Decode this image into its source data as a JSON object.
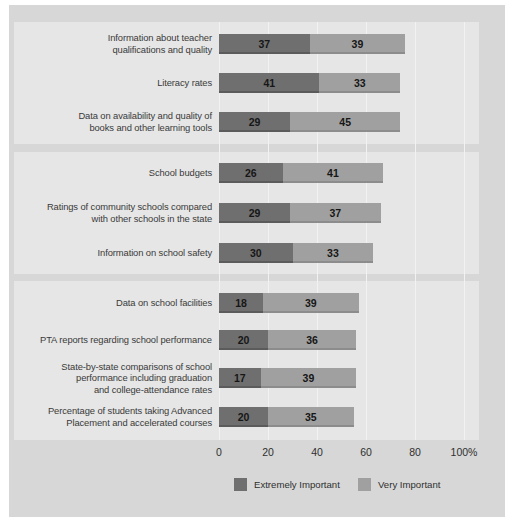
{
  "colors": {
    "page_background": "#ffffff",
    "frame_background": "#d7d7d7",
    "panel_background": "#e6e6e6",
    "gridline": "#f2f2f2",
    "extremely_important": "#6f6f6f",
    "very_important": "#a0a0a0",
    "label_text": "#3a3a3a",
    "value_text": "#161616"
  },
  "legend": {
    "items": [
      {
        "label": "Extremely Important",
        "color": "#6f6f6f",
        "swatch_name": "legend-swatch-extremely-important"
      },
      {
        "label": "Very Important",
        "color": "#a0a0a0",
        "swatch_name": "legend-swatch-very-important"
      }
    ]
  },
  "axis": {
    "ticks": [
      "0",
      "20",
      "40",
      "60",
      "80",
      "100%"
    ],
    "values": [
      0,
      20,
      40,
      60,
      80,
      100
    ]
  },
  "chart_data": {
    "type": "bar",
    "orientation": "horizontal",
    "stacked": true,
    "title": "",
    "subtitle": "",
    "xlabel": "",
    "ylabel": "",
    "xlim": [
      0,
      100
    ],
    "xticks": [
      0,
      20,
      40,
      60,
      80,
      100
    ],
    "xticklabels": [
      "0",
      "20",
      "40",
      "60",
      "80",
      "100%"
    ],
    "grid": true,
    "legend_position": "bottom",
    "series": [
      {
        "name": "Extremely Important",
        "color": "#6f6f6f",
        "values": [
          37,
          41,
          29,
          26,
          29,
          30,
          18,
          20,
          17,
          20
        ]
      },
      {
        "name": "Very Important",
        "color": "#a0a0a0",
        "values": [
          39,
          33,
          45,
          41,
          37,
          33,
          39,
          36,
          39,
          35
        ]
      }
    ],
    "categories": [
      "Information about teacher\nqualifications and quality",
      "Literacy rates",
      "Data on availability and quality of\nbooks and other learning tools",
      "School budgets",
      "Ratings of community schools compared\nwith other schools in the state",
      "Information on school safety",
      "Data on school facilities",
      "PTA reports regarding school performance",
      "State-by-state comparisons of school\nperformance including graduation\nand college-attendance rates",
      "Percentage of students taking Advanced\nPlacement and accelerated courses"
    ],
    "totals": [
      76,
      74,
      74,
      67,
      66,
      63,
      57,
      56,
      56,
      55
    ],
    "groups": [
      {
        "name": "group-1",
        "rows": [
          0,
          1,
          2
        ]
      },
      {
        "name": "group-2",
        "rows": [
          3,
          4,
          5
        ]
      },
      {
        "name": "group-3",
        "rows": [
          6,
          7,
          8,
          9
        ]
      }
    ]
  },
  "rows": [
    {
      "label": "Information about teacher\nqualifications and quality",
      "a": 37,
      "b": 39,
      "y": 34,
      "group": 0
    },
    {
      "label": "Literacy rates",
      "a": 41,
      "b": 33,
      "y": 73,
      "group": 0
    },
    {
      "label": "Data on availability and quality of\nbooks and other learning tools",
      "a": 29,
      "b": 45,
      "y": 112,
      "group": 0
    },
    {
      "label": "School budgets",
      "a": 26,
      "b": 41,
      "y": 163,
      "group": 1
    },
    {
      "label": "Ratings of community schools compared\nwith other schools in the state",
      "a": 29,
      "b": 37,
      "y": 203,
      "group": 1
    },
    {
      "label": "Information on school safety",
      "a": 30,
      "b": 33,
      "y": 243,
      "group": 1
    },
    {
      "label": "Data on school facilities",
      "a": 18,
      "b": 39,
      "y": 293,
      "group": 2
    },
    {
      "label": "PTA reports regarding school performance",
      "a": 20,
      "b": 36,
      "y": 330,
      "group": 2
    },
    {
      "label": "State-by-state comparisons of school\nperformance including graduation\nand college-attendance rates",
      "a": 17,
      "b": 39,
      "y": 368,
      "group": 2
    },
    {
      "label": "Percentage of students taking Advanced\nPlacement and accelerated courses",
      "a": 20,
      "b": 35,
      "y": 407,
      "group": 2
    }
  ],
  "panels": [
    {
      "name": "group-panel-1",
      "top": 22,
      "height": 122
    },
    {
      "name": "group-panel-2",
      "top": 152,
      "height": 122
    },
    {
      "name": "group-panel-3",
      "top": 281,
      "height": 159
    }
  ]
}
